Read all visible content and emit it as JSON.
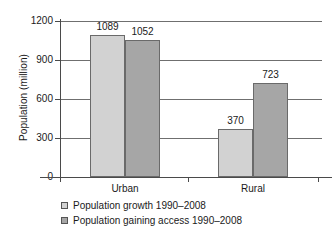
{
  "chart_data": {
    "type": "bar",
    "title": "",
    "subtitle": "",
    "xlabel": "",
    "ylabel": "Population (million)",
    "categories": [
      "Urban",
      "Rural"
    ],
    "series": [
      {
        "name": "Population growth 1990–2008",
        "values": [
          1089,
          370
        ],
        "color": "#d2d2d2"
      },
      {
        "name": "Population gaining access 1990–2008",
        "values": [
          1052,
          723
        ],
        "color": "#a6a6a6"
      }
    ],
    "ylim": [
      0,
      1200
    ],
    "ytick_labels": [
      "0",
      "300",
      "600",
      "900",
      "1200"
    ],
    "ytick_values": [
      0,
      300,
      600,
      900,
      1200
    ],
    "grid": true,
    "legend_position": "bottom-left",
    "data_labels": [
      "1089",
      "1052",
      "370",
      "723"
    ]
  },
  "axis": {
    "y_title": "Population (million)",
    "ticks": [
      {
        "label": "1200",
        "value": 1200
      },
      {
        "label": "900",
        "value": 900
      },
      {
        "label": "600",
        "value": 600
      },
      {
        "label": "300",
        "value": 300
      },
      {
        "label": "0",
        "value": 0
      }
    ]
  },
  "categories": [
    {
      "label": "Urban"
    },
    {
      "label": "Rural"
    }
  ],
  "bars": [
    {
      "label": "1089",
      "value": 1089,
      "group": "Urban",
      "series": "growth"
    },
    {
      "label": "1052",
      "value": 1052,
      "group": "Urban",
      "series": "access"
    },
    {
      "label": "370",
      "value": 370,
      "group": "Rural",
      "series": "growth"
    },
    {
      "label": "723",
      "value": 723,
      "group": "Rural",
      "series": "access"
    }
  ],
  "legend": {
    "items": [
      {
        "label": "Population growth 1990–2008",
        "color": "#d2d2d2"
      },
      {
        "label": "Population gaining access 1990–2008",
        "color": "#a6a6a6"
      }
    ]
  },
  "colors": {
    "series_light": "#d2d2d2",
    "series_dark": "#a6a6a6",
    "axis": "#4a4a4a",
    "grid": "#6f6f6f",
    "text": "#1a1a1a",
    "background": "#ffffff"
  }
}
